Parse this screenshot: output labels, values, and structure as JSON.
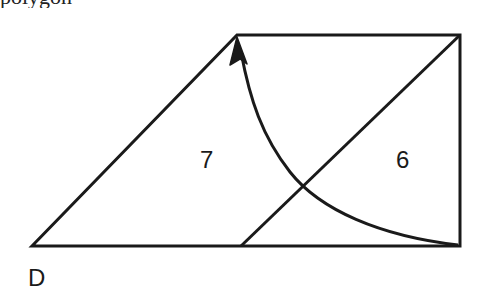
{
  "header_fragment": {
    "text": "polygon"
  },
  "diagram": {
    "stroke_color": "#1a1a1a",
    "background": "#ffffff",
    "vertices": {
      "bottom_left": [
        32,
        246
      ],
      "top_left": [
        237,
        35
      ],
      "top_right": [
        460,
        35
      ],
      "bottom_right": [
        460,
        246
      ],
      "diagonal_bottom": [
        241,
        246
      ]
    },
    "region_labels": [
      {
        "id": "left-region",
        "text": "7"
      },
      {
        "id": "right-region",
        "text": "6"
      }
    ],
    "vertex_labels": [
      {
        "id": "vertex-d",
        "text": "D"
      }
    ],
    "arrow": {
      "from": "bottom_right",
      "to": "top_left",
      "shape": "curved"
    }
  }
}
